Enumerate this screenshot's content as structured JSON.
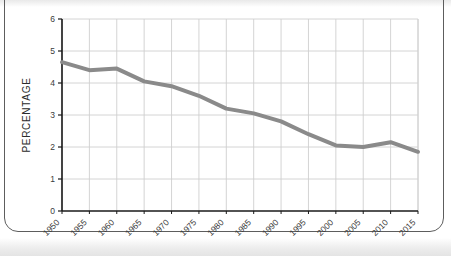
{
  "chart_data": {
    "type": "line",
    "title": "",
    "subtitle": "",
    "xlabel": "",
    "ylabel": "PERCENTAGE",
    "x": [
      1950,
      1955,
      1960,
      1965,
      1970,
      1975,
      1980,
      1985,
      1990,
      1995,
      2000,
      2005,
      2010,
      2015
    ],
    "categories": [
      "1950",
      "1955",
      "1960",
      "1965",
      "1970",
      "1975",
      "1980",
      "1985",
      "1990",
      "1995",
      "2000",
      "2005",
      "2010",
      "2015"
    ],
    "values": [
      4.65,
      4.4,
      4.45,
      4.05,
      3.9,
      3.6,
      3.2,
      3.05,
      2.8,
      2.4,
      2.05,
      2.0,
      2.15,
      1.85
    ],
    "series": [
      {
        "name": "Percentage",
        "values": [
          4.65,
          4.4,
          4.45,
          4.05,
          3.9,
          3.6,
          3.2,
          3.05,
          2.8,
          2.4,
          2.05,
          2.0,
          2.15,
          1.85
        ],
        "color": "#8a8a8a"
      }
    ],
    "xlim": [
      1950,
      2015
    ],
    "ylim": [
      0,
      6
    ],
    "yticks": [
      0,
      1,
      2,
      3,
      4,
      5,
      6
    ],
    "ytick_labels": [
      "0",
      "1",
      "2",
      "3",
      "4",
      "5",
      "6"
    ],
    "xtick_labels": [
      "1950",
      "1955",
      "1960",
      "1965",
      "1970",
      "1975",
      "1980",
      "1985",
      "1990",
      "1995",
      "2000",
      "2005",
      "2010",
      "2015"
    ],
    "grid": true,
    "grid_color": "#cfcfcf",
    "axis_color": "#1a1a1a",
    "legend": false,
    "legend_position": "none",
    "annotations": [],
    "line_color": "#8a8a8a",
    "line_width": 4,
    "background": "#ffffff"
  },
  "axes": {
    "y_axis_title": "PERCENTAGE",
    "y_ticks": [
      "6",
      "5",
      "4",
      "3",
      "2",
      "1",
      "0"
    ],
    "x_ticks": [
      "1950",
      "1955",
      "1960",
      "1965",
      "1970",
      "1975",
      "1980",
      "1985",
      "1990",
      "1995",
      "2000",
      "2005",
      "2010",
      "2015"
    ]
  },
  "colors": {
    "line": "#8a8a8a",
    "grid": "#cfcfcf",
    "axis": "#1a1a1a",
    "frame": "#5d5d5d",
    "text": "#2b2b2b"
  }
}
